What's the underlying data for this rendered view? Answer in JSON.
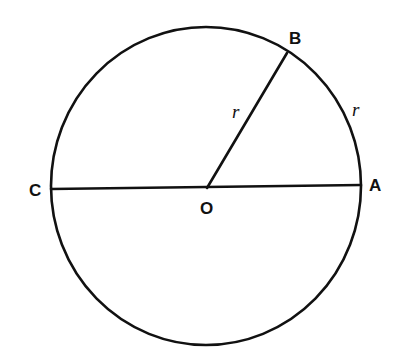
{
  "diagram": {
    "background": "#ffffff",
    "stroke_color": "#111111",
    "circle": {
      "cx": 206,
      "cy": 186,
      "rx": 155,
      "ry": 159
    },
    "points": {
      "O": {
        "label": "O",
        "x": 207,
        "y": 188
      },
      "A": {
        "label": "A",
        "x": 361,
        "y": 185
      },
      "B": {
        "label": "B",
        "x": 287,
        "y": 53
      },
      "C": {
        "label": "C",
        "x": 51,
        "y": 189
      }
    },
    "segments": [
      {
        "name": "diameter-CA",
        "from": "C",
        "to": "A"
      },
      {
        "name": "radius-OB",
        "from": "O",
        "to": "B"
      }
    ],
    "labels": {
      "B": "B",
      "A": "A",
      "C": "C",
      "O": "O",
      "radius_r": "r",
      "arc_r": "r"
    },
    "annotations": [
      {
        "text": "r",
        "refers_to": "segment OB (radius)"
      },
      {
        "text": "r",
        "refers_to": "arc AB (arc length equal to radius)"
      }
    ]
  }
}
